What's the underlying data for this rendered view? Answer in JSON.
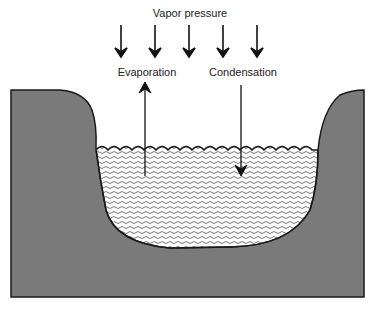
{
  "diagram": {
    "title": "Vapor pressure",
    "labels": {
      "evaporation": "Evaporation",
      "condensation": "Condensation"
    },
    "pressure_arrows": {
      "count": 5,
      "direction": "down",
      "x_positions": [
        121,
        155,
        189,
        223,
        257
      ]
    },
    "flows": [
      {
        "name": "Evaporation",
        "direction": "up"
      },
      {
        "name": "Condensation",
        "direction": "down"
      }
    ],
    "colors": {
      "ground": "#7a7a7a",
      "outline": "#1a1a1a",
      "water_pattern": "#555555",
      "background": "#ffffff"
    }
  }
}
